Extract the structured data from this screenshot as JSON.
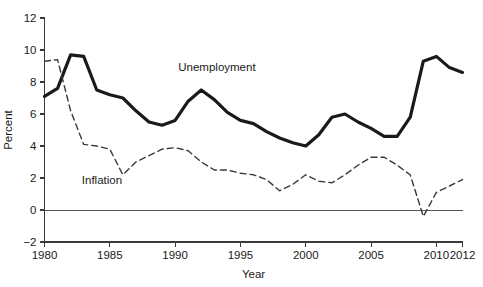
{
  "chart_data": {
    "type": "line",
    "title": "",
    "subtitle": "",
    "xlabel": "Year",
    "ylabel": "Percent",
    "xlim": [
      1980,
      2012
    ],
    "ylim": [
      -2,
      12
    ],
    "xticks": [
      1980,
      1985,
      1990,
      1995,
      2000,
      2005,
      2010,
      2012
    ],
    "xticklabels": [
      "1980",
      "1985",
      "1990",
      "1995",
      "2000",
      "2005",
      "2010",
      "2012"
    ],
    "yticks": [
      -2,
      0,
      2,
      4,
      6,
      8,
      10,
      12
    ],
    "yticklabels": [
      "−2",
      "0",
      "2",
      "4",
      "6",
      "8",
      "10",
      "12"
    ],
    "grid": false,
    "legend_position": "inline-annotation",
    "zero_line": 0,
    "x": [
      1980,
      1981,
      1982,
      1983,
      1984,
      1985,
      1986,
      1987,
      1988,
      1989,
      1990,
      1991,
      1992,
      1993,
      1994,
      1995,
      1996,
      1997,
      1998,
      1999,
      2000,
      2001,
      2002,
      2003,
      2004,
      2005,
      2006,
      2007,
      2008,
      2009,
      2010,
      2011,
      2012
    ],
    "series": [
      {
        "name": "Unemployment",
        "style": "solid",
        "color": "#1a1a1a",
        "width": 3.2,
        "label_x": 1993.2,
        "label_y": 8.7,
        "values": [
          7.1,
          7.6,
          9.7,
          9.6,
          7.5,
          7.2,
          7.0,
          6.2,
          5.5,
          5.3,
          5.6,
          6.8,
          7.5,
          6.9,
          6.1,
          5.6,
          5.4,
          4.9,
          4.5,
          4.2,
          4.0,
          4.7,
          5.8,
          6.0,
          5.5,
          5.1,
          4.6,
          4.6,
          5.8,
          9.3,
          9.6,
          8.9,
          8.6
        ]
      },
      {
        "name": "Inflation",
        "style": "dashed",
        "color": "#3a3a3a",
        "width": 1.4,
        "label_x": 1984.4,
        "label_y": 1.6,
        "values": [
          9.3,
          9.4,
          6.2,
          4.1,
          4.0,
          3.8,
          2.2,
          3.0,
          3.4,
          3.8,
          3.9,
          3.7,
          3.0,
          2.5,
          2.5,
          2.3,
          2.2,
          1.9,
          1.2,
          1.6,
          2.2,
          1.8,
          1.7,
          2.2,
          2.8,
          3.3,
          3.3,
          2.8,
          2.2,
          -0.4,
          1.1,
          1.5,
          1.9
        ]
      }
    ]
  },
  "axes": {
    "x_title": "Year",
    "y_title": "Percent"
  }
}
